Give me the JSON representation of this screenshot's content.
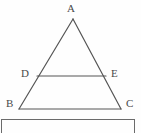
{
  "figure": {
    "type": "geometry-diagram",
    "background_color": "#fefefe",
    "stroke_color": "#555555",
    "label_color": "#4a4a4a",
    "stroke_width": 1.2,
    "labels": {
      "apex": "A",
      "left_mid": "D",
      "right_mid": "E",
      "bottom_left": "B",
      "bottom_right": "C"
    },
    "points": {
      "A": {
        "x": 73,
        "y": 19
      },
      "B": {
        "x": 19,
        "y": 109
      },
      "C": {
        "x": 121,
        "y": 109
      },
      "D": {
        "x": 37,
        "y": 76
      },
      "E": {
        "x": 106,
        "y": 76
      }
    },
    "segments": [
      {
        "name": "AB",
        "from": "A",
        "to": "B"
      },
      {
        "name": "AC",
        "from": "A",
        "to": "C"
      },
      {
        "name": "BC",
        "from": "B",
        "to": "C"
      },
      {
        "name": "DE",
        "from": "D",
        "to": "E"
      }
    ]
  },
  "bottom_panel": {
    "border_color": "#6b6b6b",
    "top": 119,
    "left": 1,
    "right": 135,
    "text": ""
  }
}
